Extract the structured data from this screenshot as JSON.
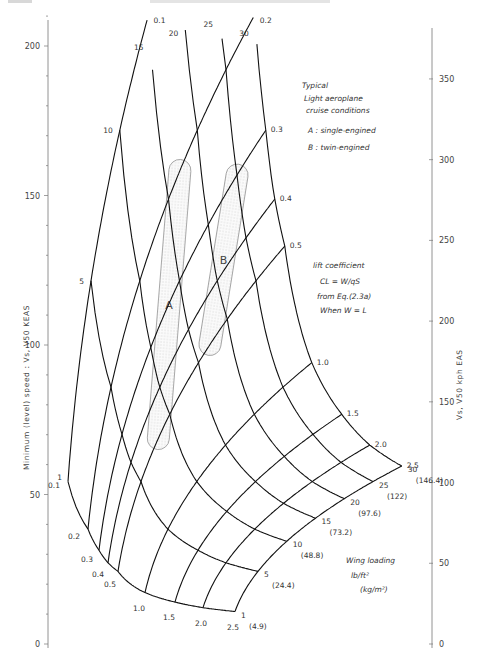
{
  "chart_data": {
    "type": "line",
    "subtype": "carpet-nomogram",
    "title": "",
    "left_axis": {
      "label": "Minimum (level) speed : Vs, V50   KEAS",
      "ticks": [
        0,
        50,
        100,
        150,
        200
      ],
      "range": [
        0,
        210
      ]
    },
    "right_axis": {
      "label": "Vs, V50   kph EAS",
      "ticks": [
        0,
        50,
        100,
        150,
        200,
        250,
        300,
        350
      ],
      "range": [
        0,
        390
      ]
    },
    "wing_loading": {
      "title_lines": [
        "Wing loading",
        "lb/ft²",
        "(kg/m²)"
      ],
      "values": [
        1,
        5,
        10,
        15,
        20,
        25,
        30
      ],
      "metric_labels": [
        "(4.9)",
        "(24.4)",
        "(48.8)",
        "(73.2)",
        "(97.6)",
        "(122)",
        "(146.4)"
      ]
    },
    "lift_coefficient": {
      "title_lines": [
        "lift coefficient",
        "CL = W/qS",
        "from Eq.(2.3a)",
        "When W = L"
      ],
      "values": [
        0.1,
        0.2,
        0.3,
        0.4,
        0.5,
        1.0,
        1.5,
        2.0,
        2.5
      ],
      "labels": [
        "0.1",
        "0.2",
        "0.3",
        "0.4",
        "0.5",
        "1.0",
        "1.5",
        "2.0",
        "2.5"
      ]
    },
    "relation": "V (kt EAS) = 17.18 * sqrt(wing_loading / CL)",
    "regions": [
      {
        "id": "A",
        "label": "A",
        "description": "single-engined",
        "wing_loading_range": [
          8,
          17
        ],
        "cl_range": [
          0.2,
          0.5
        ]
      },
      {
        "id": "B",
        "label": "B",
        "description": "twin-engined",
        "wing_loading_range": [
          17,
          25
        ],
        "cl_range": [
          0.3,
          0.5
        ]
      }
    ],
    "legend_title_lines": [
      "Typical",
      "Light aeroplane",
      "cruise conditions"
    ],
    "legend_entries": [
      "A : single-engined",
      "B : twin-engined"
    ],
    "grid": false
  }
}
